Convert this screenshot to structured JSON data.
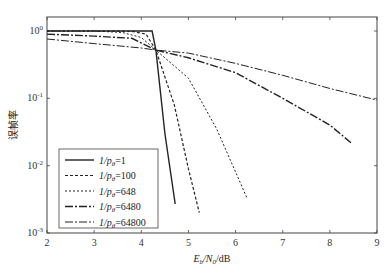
{
  "chart_data": {
    "type": "line",
    "title": "",
    "xlabel": "Eb/N0/dB",
    "ylabel": "误帧率",
    "xlim": [
      2,
      9
    ],
    "ylim": [
      0.001,
      1
    ],
    "yscale": "log",
    "xticks": [
      2,
      3,
      4,
      5,
      6,
      7,
      8,
      9
    ],
    "yticks": [
      {
        "value": 1,
        "label": "10^0"
      },
      {
        "value": 0.1,
        "label": "10^-1"
      },
      {
        "value": 0.01,
        "label": "10^-2"
      },
      {
        "value": 0.001,
        "label": "10^-3"
      }
    ],
    "grid": false,
    "legend_position": "lower left",
    "series": [
      {
        "name": "1/pθ=1",
        "style": "solid",
        "x": [
          2,
          3,
          4,
          4.23,
          4.31,
          4.5,
          4.72
        ],
        "y": [
          1.0,
          1.0,
          1.0,
          1.0,
          0.52,
          0.03,
          0.0027
        ]
      },
      {
        "name": "1/pθ=100",
        "style": "dashed",
        "x": [
          2,
          3,
          3.8,
          4.1,
          4.31,
          4.7,
          5.0,
          5.23
        ],
        "y": [
          1.0,
          1.0,
          0.99,
          0.9,
          0.52,
          0.08,
          0.009,
          0.002
        ]
      },
      {
        "name": "1/pθ=648",
        "style": "dotted",
        "x": [
          2,
          3,
          3.6,
          4.0,
          4.31,
          5.0,
          5.6,
          6.25
        ],
        "y": [
          1.0,
          1.0,
          0.95,
          0.8,
          0.52,
          0.2,
          0.035,
          0.0032
        ]
      },
      {
        "name": "1/pθ=6480",
        "style": "dashdot-thick",
        "x": [
          2,
          3,
          3.8,
          4.31,
          5.0,
          6.0,
          7.0,
          8.0,
          8.48
        ],
        "y": [
          0.9,
          0.84,
          0.78,
          0.52,
          0.4,
          0.24,
          0.1,
          0.04,
          0.021
        ]
      },
      {
        "name": "1/pθ=64800",
        "style": "dashdot",
        "x": [
          2,
          3,
          4.0,
          4.31,
          5.0,
          6.0,
          7.0,
          8.0,
          9.0
        ],
        "y": [
          0.76,
          0.65,
          0.56,
          0.52,
          0.47,
          0.33,
          0.22,
          0.14,
          0.094
        ]
      }
    ]
  },
  "labels": {
    "ylabel": "误帧率",
    "xlabel_E": "E",
    "xlabel_b": "b",
    "xlabel_mid": "/N",
    "xlabel_0": "0",
    "xlabel_end": "/dB"
  },
  "legend": [
    {
      "prefix": "1/p",
      "sub": "θ",
      "suffix": "=1"
    },
    {
      "prefix": "1/p",
      "sub": "θ",
      "suffix": "=100"
    },
    {
      "prefix": "1/p",
      "sub": "θ",
      "suffix": "=648"
    },
    {
      "prefix": "1/p",
      "sub": "θ",
      "suffix": "=6480"
    },
    {
      "prefix": "1/p",
      "sub": "θ",
      "suffix": "=64800"
    }
  ],
  "colors": {
    "line": "#222222",
    "frame": "#444444"
  }
}
